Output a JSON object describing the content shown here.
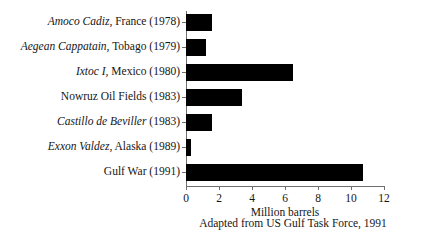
{
  "chart_data": {
    "type": "bar",
    "orientation": "horizontal",
    "title": "",
    "xlabel": "Million barrels",
    "ylabel": "",
    "xlim": [
      0,
      12
    ],
    "xticks": [
      0,
      2,
      4,
      6,
      8,
      10,
      12
    ],
    "grid": false,
    "legend": null,
    "bar_color": "#000000",
    "axis_color": "#6f6f6f",
    "source_note": "Adapted from US Gulf Task Force, 1991",
    "categories": [
      "Amoco Cadiz, France (1978)",
      "Aegean Cappatain, Tobago (1979)",
      "Ixtoc I, Mexico (1980)",
      "Nowruz Oil Fields (1983)",
      "Castillo de Beviller (1983)",
      "Exxon Valdez, Alaska (1989)",
      "Gulf War (1991)"
    ],
    "values": [
      1.6,
      1.2,
      6.5,
      3.4,
      1.6,
      0.3,
      10.7
    ],
    "items": [
      {
        "name_italic": "Amoco Cadiz,",
        "name_roman": "France (1978)",
        "value": 1.6
      },
      {
        "name_italic": "Aegean Cappatain,",
        "name_roman": "Tobago (1979)",
        "value": 1.2
      },
      {
        "name_italic": "Ixtoc I,",
        "name_roman": "Mexico (1980)",
        "value": 6.5
      },
      {
        "name_italic": "",
        "name_roman": "Nowruz Oil Fields (1983)",
        "value": 3.4
      },
      {
        "name_italic": "Castillo de Beviller",
        "name_roman": "(1983)",
        "value": 1.6
      },
      {
        "name_italic": "Exxon Valdez,",
        "name_roman": "Alaska (1989)",
        "value": 0.3
      },
      {
        "name_italic": "",
        "name_roman": "Gulf War (1991)",
        "value": 10.7
      }
    ],
    "xticklabels": [
      "0",
      "2",
      "4",
      "6",
      "8",
      "10",
      "12"
    ]
  }
}
